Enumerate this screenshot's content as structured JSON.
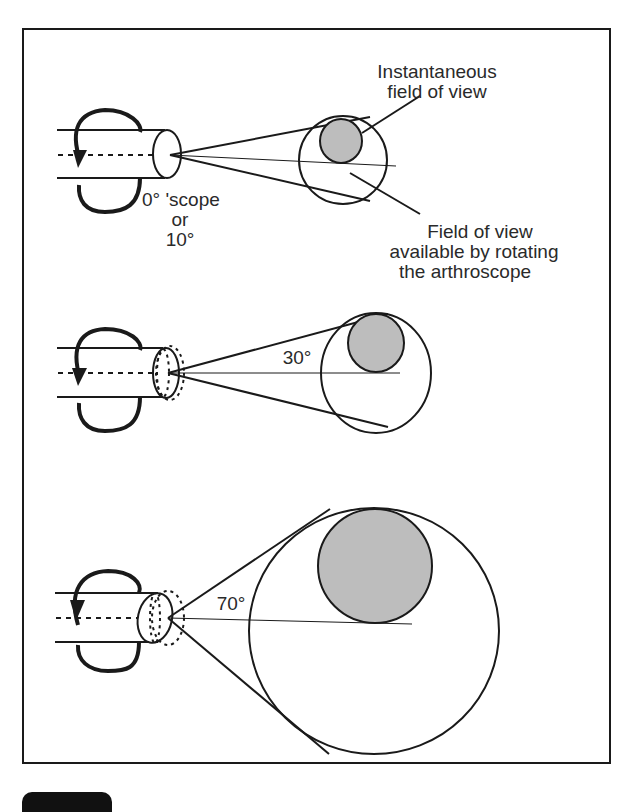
{
  "figure": {
    "labels": {
      "instantaneous_line1": "Instantaneous",
      "instantaneous_line2": "field of view",
      "scope_line1": "0° 'scope",
      "scope_line2": "or",
      "scope_line3": "10°",
      "available_line1": "Field of view",
      "available_line2": "available by rotating",
      "available_line3": "the arthroscope",
      "angle_30": "30°",
      "angle_70": "70°"
    },
    "panels": [
      {
        "name": "scope-0-10-degree",
        "angle_label": "0° 'scope or 10°"
      },
      {
        "name": "scope-30-degree",
        "angle_label": "30°"
      },
      {
        "name": "scope-70-degree",
        "angle_label": "70°"
      }
    ],
    "colors": {
      "line": "#1a1a1a",
      "shaded_fov": "#bdbdbd",
      "background": "#ffffff"
    }
  }
}
